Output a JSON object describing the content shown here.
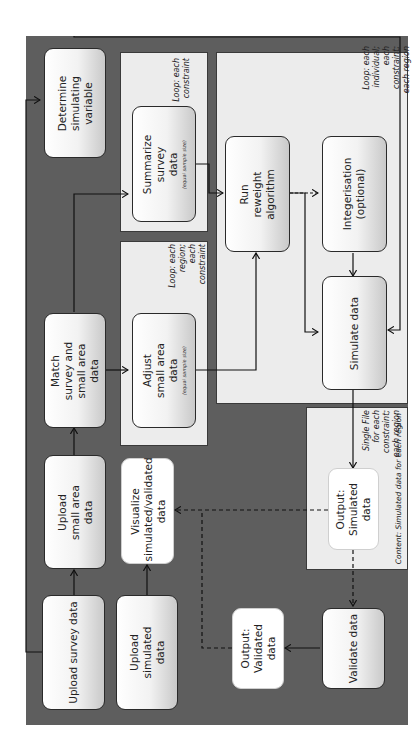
{
  "diagram": {
    "orientation": "rotated-90-ccw",
    "colors": {
      "background": "#5e5e5e",
      "panel": "#ececec",
      "box_border": "#2a2a2a",
      "line": "#1a1a1a"
    },
    "boxes": {
      "determine": "Determine simulating variable",
      "summarize": "Summarize survey data",
      "summarize_sub": "(equal sample size)",
      "match": "Match survey and small area data",
      "adjust": "Adjust small area data",
      "adjust_sub": "(equal sample size)",
      "reweight": "Run reweight algorithm",
      "integerisation": "Integerisation (optional)",
      "simulate": "Simulate data",
      "upload_small_area": "Upload small area data",
      "upload_survey": "Upload survey data",
      "upload_simulated": "Upload simulated data",
      "visualize": "Visualize simulated/validated data",
      "output_simulated": "Output: Simulated data",
      "output_validated": "Output: Validated data",
      "validate": "Validate data"
    },
    "notes": {
      "loop_constraint": "Loop: each constraint",
      "loop_region_constraint": "Loop: each region; each constraint",
      "loop_individual": "Loop: each individual; each constraint; each region",
      "single_file": "Single File for each constraint; each region",
      "content": "Content: Simulated data for each region"
    }
  }
}
